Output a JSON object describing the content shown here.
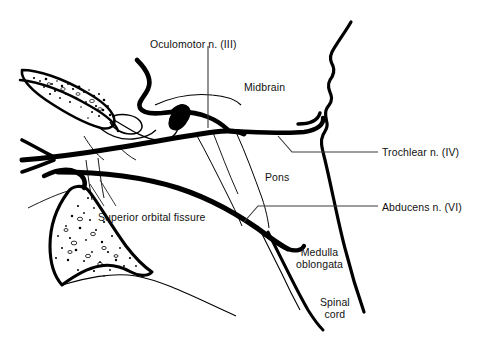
{
  "figure": {
    "background_color": "#ffffff",
    "ink_color": "#000000",
    "leader_color": "#3a3a3a"
  },
  "labels": {
    "oculomotor": "Oculomotor n. (III)",
    "trochlear": "Trochlear n. (IV)",
    "abducens": "Abducens n. (VI)",
    "superior_orbital_fissure": "Superior orbital fissure",
    "midbrain": "Midbrain",
    "pons": "Pons",
    "medulla": "Medulla\noblongata",
    "spinal_cord": "Spinal\ncord"
  },
  "label_positions": {
    "oculomotor": {
      "x": 150,
      "y": 38
    },
    "trochlear": {
      "x": 382,
      "y": 146
    },
    "abducens": {
      "x": 382,
      "y": 201
    },
    "superior_orbital_fissure": {
      "x": 98,
      "y": 211
    },
    "midbrain": {
      "x": 244,
      "y": 81
    },
    "pons": {
      "x": 265,
      "y": 171
    },
    "medulla": {
      "x": 296,
      "y": 246
    },
    "spinal_cord": {
      "x": 320,
      "y": 296
    }
  },
  "structures": [
    {
      "name": "sphenoid-bone-upper",
      "kind": "bone-cross-section",
      "texture": "stippled-trabecular"
    },
    {
      "name": "sphenoid-body-bone-lower",
      "kind": "bone-cross-section",
      "texture": "stippled-trabecular"
    },
    {
      "name": "brainstem-posterior-contour",
      "kind": "outline"
    },
    {
      "name": "brainstem-anterior-contour",
      "kind": "outline"
    },
    {
      "name": "oculomotor-nerve-trunk",
      "kind": "nerve",
      "weight": "thick"
    },
    {
      "name": "trochlear-nerve-trunk",
      "kind": "nerve",
      "weight": "thick"
    },
    {
      "name": "abducens-nerve-trunk",
      "kind": "nerve",
      "weight": "thick"
    },
    {
      "name": "nerve-thin-branches",
      "kind": "nerve",
      "weight": "thin"
    }
  ]
}
